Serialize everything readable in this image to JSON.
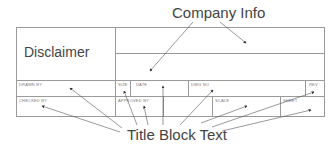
{
  "title_callout": "Company Info",
  "bottom_callout": "Title Block Text",
  "disclaimer_label": "Disclaimer",
  "fields": {
    "drawn_by": "DRAWN BY",
    "size": "SIZE",
    "date": "DATE",
    "dwg_no": "DWG NO",
    "rev": "REV",
    "checked_by": "CHECKED BY",
    "approved_by": "APPROVED BY",
    "scale": "SCALE",
    "sheet": "SHEET"
  },
  "colors": {
    "line": "#9a9a9a",
    "text": "#444444",
    "arrow": "#333333"
  }
}
